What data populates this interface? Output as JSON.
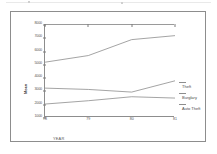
{
  "chart_data": {
    "type": "line",
    "title": "",
    "subtitle": "",
    "xlabel": "YEAR",
    "ylabel": "Mean",
    "x": [
      "78",
      "79",
      "80",
      "81"
    ],
    "categories": [
      "78",
      "79",
      "80",
      "81"
    ],
    "xlim": [
      78,
      81
    ],
    "ylim": [
      1000,
      8000
    ],
    "grid": false,
    "legend_position": "right",
    "y_ticks": [
      "8000",
      "7000",
      "6000",
      "5000",
      "4000",
      "3000",
      "2000",
      "1000"
    ],
    "y_tick_values": [
      8000,
      7000,
      6000,
      5000,
      4000,
      3000,
      2000,
      1000
    ],
    "x_ticks": [
      "78",
      "79",
      "80",
      "81"
    ],
    "series": [
      {
        "name": "Theft",
        "values": [
          5200,
          5700,
          6900,
          7200
        ],
        "color": "#8d8d8d"
      },
      {
        "name": "Burglary",
        "values": [
          3250,
          3150,
          2950,
          3800
        ],
        "color": "#8d8d8d"
      },
      {
        "name": "Auto Theft",
        "values": [
          2050,
          2300,
          2600,
          2500
        ],
        "color": "#8d8d8d"
      }
    ],
    "legend": [
      {
        "label": "Theft",
        "color": "#8d8d8d"
      },
      {
        "label": "Burglary",
        "color": "#8d8d8d"
      },
      {
        "label": "Auto Theft",
        "color": "#8d8d8d"
      }
    ],
    "colors": {
      "axis": "#8d8d8d",
      "line": "#8d8d8d",
      "tick_text": "#555555",
      "frame": "#8d8d8d",
      "background": "#ffffff"
    }
  }
}
